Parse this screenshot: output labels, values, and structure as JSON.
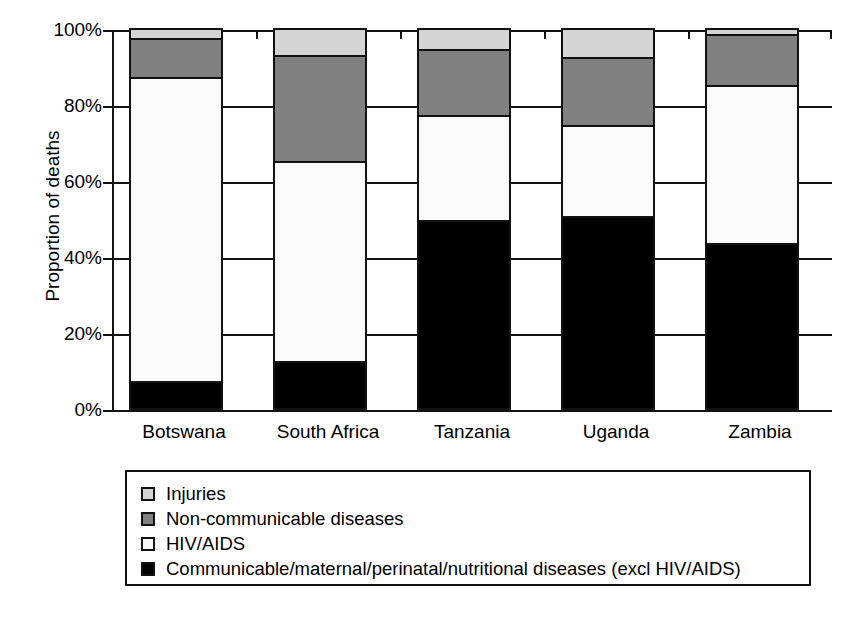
{
  "chart_data": {
    "type": "bar",
    "subtype": "stacked-bar-100-percent",
    "title": "",
    "xlabel": "",
    "ylabel": "Proportion of deaths",
    "ylim": [
      0,
      100
    ],
    "ytick_labels": [
      "0%",
      "20%",
      "40%",
      "60%",
      "80%",
      "100%"
    ],
    "ytick_values": [
      0,
      20,
      40,
      60,
      80,
      100
    ],
    "grid": true,
    "grid_axis": "y",
    "legend_position": "below-plot",
    "categories": [
      "Botswana",
      "South Africa",
      "Tanzania",
      "Uganda",
      "Zambia"
    ],
    "series": [
      {
        "name": "Communicable/maternal/perinatal/nutritional diseases (excl HIV/AIDS)",
        "color": "#000000",
        "values": [
          7.0,
          12.5,
          49.5,
          50.5,
          43.5
        ]
      },
      {
        "name": "HIV/AIDS",
        "color": "#fafafa",
        "values": [
          80.0,
          52.5,
          27.5,
          24.0,
          41.5
        ]
      },
      {
        "name": "Non-communicable diseases",
        "color": "#808080",
        "values": [
          10.5,
          28.0,
          17.5,
          18.0,
          13.5
        ]
      },
      {
        "name": "Injuries",
        "color": "#d4d4d4",
        "values": [
          2.5,
          7.0,
          5.5,
          7.5,
          1.5
        ]
      }
    ],
    "stack_order_bottom_to_top": [
      "Communicable/maternal/perinatal/nutritional diseases (excl HIV/AIDS)",
      "HIV/AIDS",
      "Non-communicable diseases",
      "Injuries"
    ]
  },
  "axes": {
    "y_title": "Proportion of deaths",
    "y_ticks": [
      {
        "label": "100%",
        "value": 100
      },
      {
        "label": "80%",
        "value": 80
      },
      {
        "label": "60%",
        "value": 60
      },
      {
        "label": "40%",
        "value": 40
      },
      {
        "label": "20%",
        "value": 20
      },
      {
        "label": "0%",
        "value": 0
      }
    ],
    "x_ticks": [
      {
        "label": "Botswana"
      },
      {
        "label": "South Africa"
      },
      {
        "label": "Tanzania"
      },
      {
        "label": "Uganda"
      },
      {
        "label": "Zambia"
      }
    ]
  },
  "legend": {
    "items": [
      {
        "label": "Injuries",
        "color": "#d4d4d4",
        "swatch": "injuries-swatch"
      },
      {
        "label": "Non-communicable diseases",
        "color": "#808080",
        "swatch": "non-communicable-swatch"
      },
      {
        "label": "HIV/AIDS",
        "color": "#fafafa",
        "swatch": "hiv-aids-swatch"
      },
      {
        "label": "Communicable/maternal/perinatal/nutritional diseases (excl HIV/AIDS)",
        "color": "#000000",
        "swatch": "communicable-swatch"
      }
    ]
  },
  "colors": {
    "injuries": "#d4d4d4",
    "non_communicable": "#808080",
    "hiv_aids": "#fafafa",
    "communicable": "#000000",
    "axis": "#111111",
    "background": "#ffffff"
  }
}
